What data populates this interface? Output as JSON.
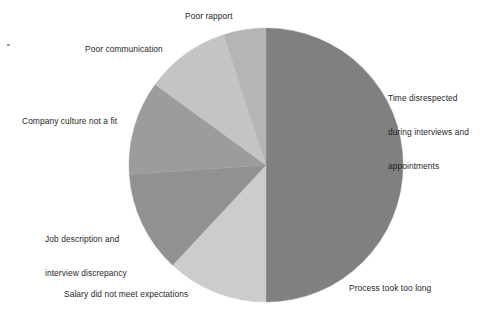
{
  "chart_data": {
    "type": "pie",
    "title": "",
    "legend_position": "none",
    "labels_position": "outside",
    "start_angle_deg": 0,
    "direction": "clockwise",
    "center": {
      "x": 266,
      "y": 165
    },
    "radius": 137,
    "categories": [
      "Time disrespected during interviews and appointments",
      "Process took too long",
      "Salary did not meet expectations",
      "Job description and interview discrepancy",
      "Company culture not a fit",
      "Poor communication",
      "Poor rapport"
    ],
    "values": [
      25,
      25,
      12,
      12,
      11,
      10,
      5
    ],
    "slices": [
      {
        "label": "Time disrespected during interviews and appointments",
        "label_lines": [
          "Time disrespected",
          "during interviews and",
          "appointments"
        ],
        "value": 25,
        "percent": 25,
        "color": "#808080",
        "start_angle_deg": 0,
        "end_angle_deg": 90
      },
      {
        "label": "Process took too long",
        "label_lines": [
          "Process took too long"
        ],
        "value": 25,
        "percent": 25,
        "color": "#808080",
        "start_angle_deg": 90,
        "end_angle_deg": 180
      },
      {
        "label": "Salary did not meet expectations",
        "label_lines": [
          "Salary did not meet expectations"
        ],
        "value": 12,
        "percent": 12,
        "color": "#cccccc",
        "start_angle_deg": 180,
        "end_angle_deg": 223
      },
      {
        "label": "Job description and interview discrepancy",
        "label_lines": [
          "Job description and",
          "interview discrepancy"
        ],
        "value": 12,
        "percent": 12,
        "color": "#919191",
        "start_angle_deg": 223,
        "end_angle_deg": 266
      },
      {
        "label": "Company culture not a fit",
        "label_lines": [
          "Company culture not a fit"
        ],
        "value": 11,
        "percent": 11,
        "color": "#9c9c9c",
        "start_angle_deg": 266,
        "end_angle_deg": 306
      },
      {
        "label": "Poor communication",
        "label_lines": [
          "Poor communication"
        ],
        "value": 10,
        "percent": 10,
        "color": "#c4c4c4",
        "start_angle_deg": 306,
        "end_angle_deg": 342
      },
      {
        "label": "Poor rapport",
        "label_lines": [
          "Poor rapport"
        ],
        "value": 5,
        "percent": 5,
        "color": "#b5b5b5",
        "start_angle_deg": 342,
        "end_angle_deg": 360
      }
    ],
    "background_color": "#ffffff",
    "text_color": "#1f1f1f"
  },
  "labels": {
    "time_disrespected": {
      "line1": "Time disrespected",
      "line2": "during interviews and",
      "line3": "appointments"
    },
    "process_took_too_long": "Process took too long",
    "salary_expectations": "Salary did not meet expectations",
    "job_description": {
      "line1": "Job description and",
      "line2": "interview discrepancy"
    },
    "company_culture": "Company culture not a fit",
    "poor_communication": "Poor communication",
    "poor_rapport": "Poor rapport"
  }
}
